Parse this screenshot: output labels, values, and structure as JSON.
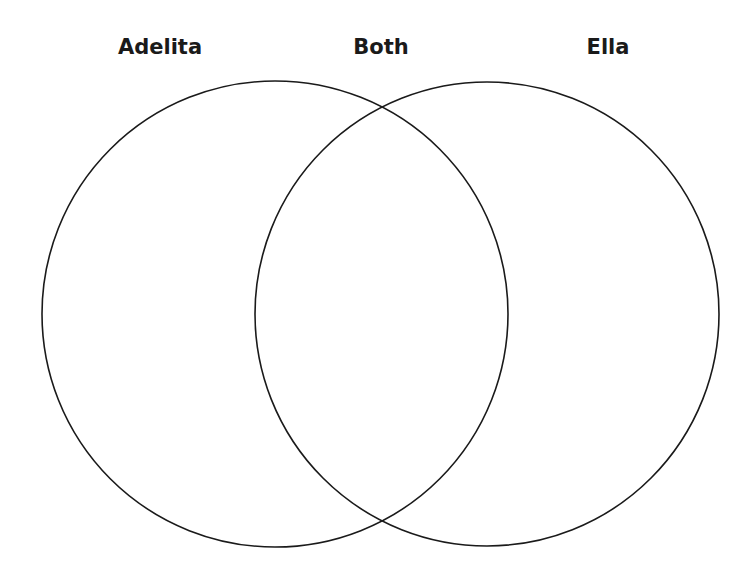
{
  "diagram": {
    "type": "venn",
    "labels": {
      "left": "Adelita",
      "middle": "Both",
      "right": "Ella"
    },
    "circles": [
      {
        "name": "Adelita",
        "cx": 275,
        "cy": 314,
        "r": 233
      },
      {
        "name": "Ella",
        "cx": 487,
        "cy": 314,
        "r": 232
      }
    ],
    "stroke_color": "#1a1a1a",
    "background_color": "#ffffff"
  }
}
